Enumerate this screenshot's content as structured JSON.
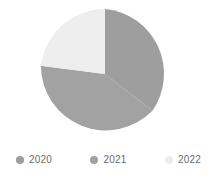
{
  "chart_data": {
    "type": "pie",
    "title": "",
    "categories": [
      "2020",
      "2021",
      "2022"
    ],
    "values": [
      37,
      36,
      27
    ],
    "unit": "%",
    "colors": [
      "#9e9e9e",
      "#a2a2a2",
      "#eeeeee"
    ],
    "legend_position": "bottom",
    "grid": false,
    "start_angle_deg": 0,
    "direction": "clockwise",
    "slices": [
      {
        "label": "2020",
        "value": 37,
        "color": "#9e9e9e",
        "start_deg": 0,
        "end_deg": 133.2
      },
      {
        "label": "2021",
        "value": 36,
        "color": "#a2a2a2",
        "start_deg": 133.2,
        "end_deg": 262.8
      },
      {
        "label": "2022",
        "value": 27,
        "color": "#eeeeee",
        "start_deg": 262.8,
        "end_deg": 360
      }
    ]
  },
  "pie": {
    "center_x": 105,
    "center_y": 74,
    "radius": 65,
    "slice_2020_path": "M 105 74 L 105 9 A 65 65 0 0 1 152.43 110.76 Z",
    "slice_2021_path": "M 105 74 L 152.43 110.76 A 65 65 0 0 1 40.83 65.76 Z",
    "slice_2022_path": "M 105 74 L 40.83 65.76 A 65 65 0 0 1 105 9 Z"
  },
  "legend": {
    "items": [
      {
        "label": "2020",
        "color": "#9e9e9e",
        "marker": "circle-marker-icon"
      },
      {
        "label": "2021",
        "color": "#a2a2a2",
        "marker": "circle-marker-icon"
      },
      {
        "label": "2022",
        "color": "#eeeeee",
        "marker": "circle-marker-icon"
      }
    ]
  }
}
